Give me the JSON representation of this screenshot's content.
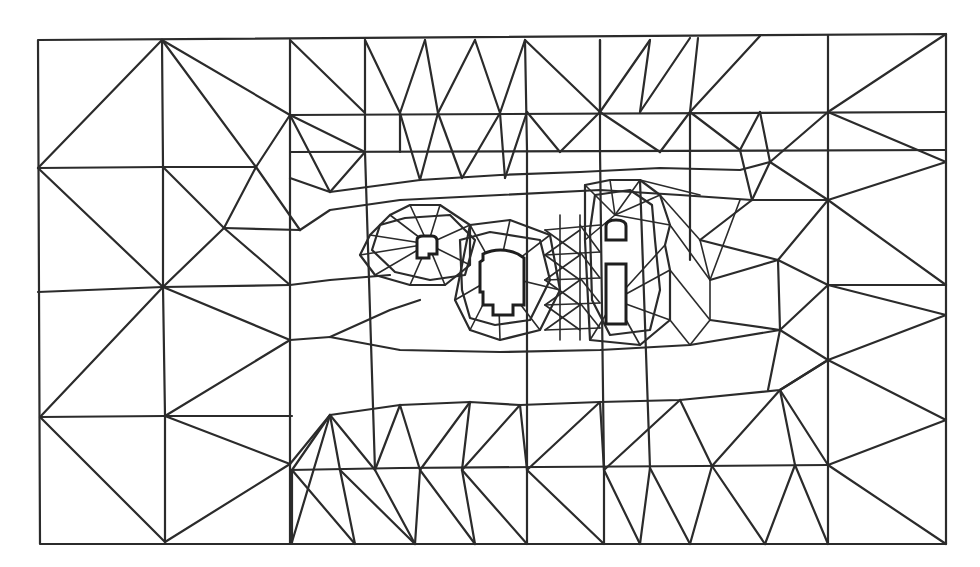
{
  "diagram": {
    "type": "triangular-finite-element-mesh",
    "colors": {
      "background": "#ffffff",
      "edges": "#2b2b2b"
    },
    "outer_boundary": {
      "x": 38,
      "y": 34,
      "width": 908,
      "height": 510
    },
    "holes": [
      {
        "name": "small-left-opening",
        "shape": "arched-rectangle-notched"
      },
      {
        "name": "central-opening",
        "shape": "arched-rectangle-stepped"
      },
      {
        "name": "right-upper-opening",
        "shape": "arched-rectangle"
      },
      {
        "name": "right-lower-opening",
        "shape": "rectangle"
      }
    ],
    "refinement": "mesh is coarse near the outer boundary and highly refined around the openings"
  }
}
